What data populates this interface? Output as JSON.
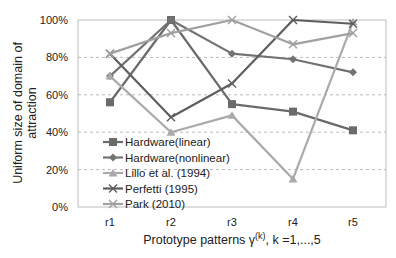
{
  "chart_data": {
    "type": "line",
    "title": "",
    "xlabel": "Prototype patterns γ(k), k =1,...,5",
    "xlabel_main": "Prototype patterns γ",
    "xlabel_sup": "(k)",
    "xlabel_tail": ", k =1,...,5",
    "ylabel_line1": "Uniform size of domain of",
    "ylabel_line2": "attraction",
    "ylabel": "Uniform size of domain of attraction",
    "ylim": [
      0,
      100
    ],
    "yticks": [
      "0%",
      "20%",
      "40%",
      "60%",
      "80%",
      "100%"
    ],
    "categories": [
      "r1",
      "r2",
      "r3",
      "r4",
      "r5"
    ],
    "grid": "horizontal dashed",
    "legend_position": "inside lower-left",
    "series": [
      {
        "name": "Hardware(linear)",
        "marker": "square",
        "color": "#6a6a6a",
        "values": [
          56,
          100,
          55,
          51,
          41
        ]
      },
      {
        "name": "Hardware(nonlinear)",
        "marker": "diamond",
        "color": "#727272",
        "values": [
          70,
          100,
          82,
          79,
          72
        ]
      },
      {
        "name": "Lillo et al. (1994)",
        "marker": "triangle",
        "color": "#aaaaaa",
        "values": [
          70,
          40,
          49,
          15,
          99
        ]
      },
      {
        "name": "Perfetti (1995)",
        "marker": "x",
        "color": "#5e5e5e",
        "values": [
          82,
          48,
          66,
          100,
          98
        ]
      },
      {
        "name": "Park (2010)",
        "marker": "x",
        "color": "#a0a0a0",
        "values": [
          82,
          93,
          100,
          87,
          93
        ]
      }
    ]
  }
}
